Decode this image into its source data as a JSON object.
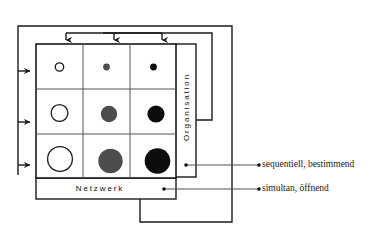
{
  "diagram": {
    "axes": {
      "vertical_label": "Organisation",
      "horizontal_label": "Netzwerk"
    },
    "legend": [
      {
        "id": "sequentiell",
        "text": "sequentiell, bestimmend",
        "source": "organisation-axis-dot"
      },
      {
        "id": "simultan",
        "text": "simultan, öffnend",
        "source": "netzwerk-axis-dot"
      }
    ],
    "colors": {
      "stroke": "#1a1a1a",
      "grid_line": "#555555",
      "circle_empty_fill": "#ffffff",
      "circle_gray_fill": "#4d4d4d",
      "circle_black_fill": "#0d0d0d",
      "text": "#1a1a1a"
    },
    "matrix": {
      "rows": 3,
      "cols": 3,
      "cells": [
        {
          "row": 0,
          "col": 0,
          "fill": "empty",
          "size": "small"
        },
        {
          "row": 0,
          "col": 1,
          "fill": "gray",
          "size": "small"
        },
        {
          "row": 0,
          "col": 2,
          "fill": "black",
          "size": "small"
        },
        {
          "row": 1,
          "col": 0,
          "fill": "empty",
          "size": "medium"
        },
        {
          "row": 1,
          "col": 1,
          "fill": "gray",
          "size": "medium"
        },
        {
          "row": 1,
          "col": 2,
          "fill": "black",
          "size": "medium"
        },
        {
          "row": 2,
          "col": 0,
          "fill": "empty",
          "size": "large"
        },
        {
          "row": 2,
          "col": 1,
          "fill": "gray",
          "size": "large"
        },
        {
          "row": 2,
          "col": 2,
          "fill": "black",
          "size": "large"
        }
      ]
    },
    "feedback_arrows": {
      "top_into_columns": 3,
      "left_into_rows": 3,
      "outer_loop": "netzwerk-bottom-to-left-spine",
      "inner_loop": "organisation-right-to-top-spine"
    }
  }
}
